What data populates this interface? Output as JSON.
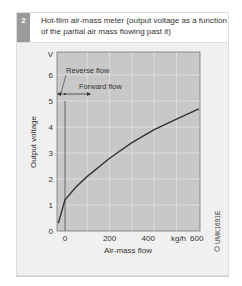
{
  "figure": {
    "number": "2",
    "caption": "Hot-film air-mass meter (output voltage as a function of the partial air mass flowing past it)",
    "code": "UMK1691E"
  },
  "chart_data": {
    "type": "line",
    "title": "Hot-film air-mass meter (output voltage as a function of the partial air mass flowing past it)",
    "xlabel": "Air-mass flow",
    "ylabel": "Output voltage",
    "x_unit": "kg/h",
    "y_unit": "V",
    "xlim": [
      -30,
      640
    ],
    "ylim": [
      0,
      7
    ],
    "x_ticks": [
      "0",
      "200",
      "400",
      "kg/h",
      "600"
    ],
    "y_ticks": [
      "0",
      "1",
      "2",
      "3",
      "4",
      "5",
      "6",
      "V"
    ],
    "grid": true,
    "annotations": [
      "Reverse flow",
      "Forward flow"
    ],
    "series": [
      {
        "name": "Output voltage",
        "x": [
          -30,
          0,
          50,
          100,
          200,
          300,
          400,
          500,
          600
        ],
        "y": [
          0.3,
          1.2,
          1.7,
          2.1,
          2.8,
          3.4,
          3.9,
          4.3,
          4.7
        ]
      }
    ]
  }
}
